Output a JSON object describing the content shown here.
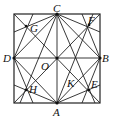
{
  "diagram": {
    "type": "geometry",
    "labels": {
      "A": "A",
      "B": "B",
      "C": "C",
      "D": "D",
      "O": "O",
      "E": "E",
      "F": "F",
      "G": "G",
      "H": "H",
      "K": "K"
    },
    "colors": {
      "stroke": "#222222",
      "background": "#ffffff"
    }
  }
}
